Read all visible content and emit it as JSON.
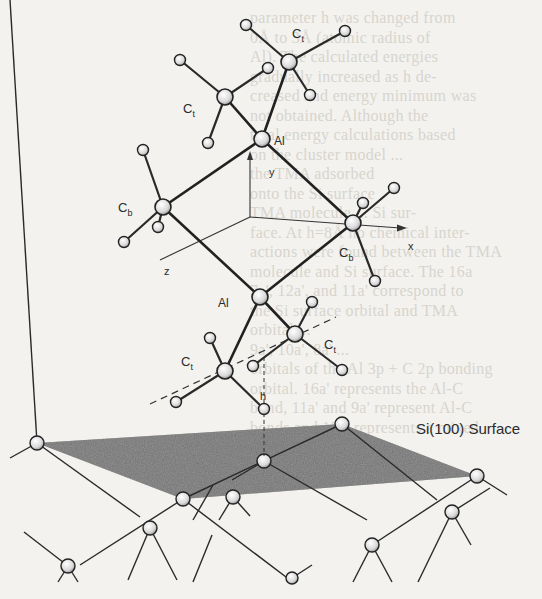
{
  "figure": {
    "atom_labels": {
      "al_top": "Al",
      "al_bottom": "Al",
      "ct_top_left": "C",
      "ct_top_left_sub": "t",
      "ct_top_right": "C",
      "ct_top_right_sub": "t",
      "cb_left": "C",
      "cb_left_sub": "b",
      "cb_right": "C",
      "cb_right_sub": "b",
      "ct_bottom_left": "C",
      "ct_bottom_left_sub": "t",
      "ct_bottom_right": "C",
      "ct_bottom_right_sub": "t"
    },
    "axis_labels": {
      "x": "x",
      "y": "y",
      "z": "z"
    },
    "height_label": "h",
    "surface_label": "Si(100) Surface"
  },
  "bleed_through_text": [
    "parameter h was changed from",
    "0Å to 3Å (atomic radius of",
    "Al). The calculated energies",
    "gradually increased as h de-",
    "creased and energy minimum was",
    "not obtained. Although the",
    "total energy calculations based",
    "on the cluster model ...",
    "the TMA adsorbed",
    "onto the Si surface",
    "TMA molecule ... Si sur-",
    "face. At h=8Å no chemical inter-",
    "actions were found between the TMA",
    "molecule and Si surface. The 16a",
    "7a', 12a', and 11a' correspond to",
    "the Si surface orbital and TMA",
    "orbital ...",
    "9a', 10a', 8a' ...",
    "orbitals of the Al 3p + C 2p bonding",
    "orbital. 16a' represents the Al-C",
    "bond, 11a' and 9a' represent Al-C",
    "bonds and 15a' represents a mixed"
  ]
}
